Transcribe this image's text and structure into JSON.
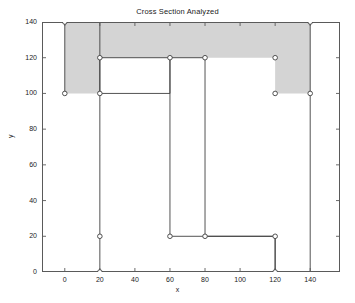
{
  "chart_data": {
    "type": "line",
    "title": "Cross Section Analyzed",
    "xlabel": "x",
    "ylabel": "y",
    "xlim": [
      -13,
      157
    ],
    "ylim": [
      0,
      140
    ],
    "xticks": [
      0,
      20,
      40,
      60,
      80,
      100,
      120,
      140
    ],
    "yticks": [
      0,
      20,
      40,
      60,
      80,
      100,
      120,
      140
    ],
    "grid": false,
    "legend": null,
    "marker": "open-circle",
    "line_color": "#404040",
    "fill_color": "#d4d4d4",
    "series": [
      {
        "name": "cross-section-outline",
        "closed": false,
        "x": [
          0,
          0,
          20,
          20,
          60,
          60,
          20,
          20,
          120,
          120,
          60,
          60,
          80,
          80,
          120,
          120,
          140,
          140,
          0
        ],
        "y": [
          100,
          140,
          140,
          100,
          100,
          120,
          120,
          0,
          0,
          20,
          20,
          120,
          120,
          20,
          20,
          0,
          0,
          140,
          140
        ],
        "points": [
          {
            "x": 0,
            "y": 140
          },
          {
            "x": 0,
            "y": 100
          },
          {
            "x": 20,
            "y": 100
          },
          {
            "x": 20,
            "y": 120
          },
          {
            "x": 60,
            "y": 120
          },
          {
            "x": 60,
            "y": 20
          },
          {
            "x": 20,
            "y": 20
          },
          {
            "x": 20,
            "y": 0
          },
          {
            "x": 120,
            "y": 0
          },
          {
            "x": 120,
            "y": 20
          },
          {
            "x": 80,
            "y": 20
          },
          {
            "x": 80,
            "y": 120
          },
          {
            "x": 120,
            "y": 120
          },
          {
            "x": 120,
            "y": 100
          },
          {
            "x": 140,
            "y": 100
          },
          {
            "x": 140,
            "y": 140
          }
        ]
      }
    ],
    "shaded_region": {
      "name": "analyzed-flange-area",
      "x": [
        0,
        140,
        140,
        120,
        120,
        80,
        60,
        20,
        20,
        0
      ],
      "y": [
        140,
        140,
        100,
        100,
        120,
        120,
        120,
        120,
        100,
        100
      ]
    }
  }
}
